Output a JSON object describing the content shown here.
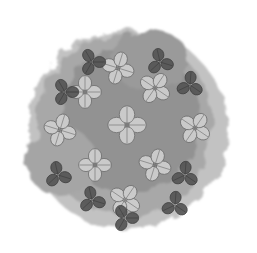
{
  "image": {
    "description": "Grayscale illustration of clustered four-leaf and three-leaf clovers over a soft watercolor-style gray blob on white background",
    "background": "#ffffff",
    "blob_colors": [
      "#8a8a8a",
      "#9c9c9c",
      "#b5b5b5",
      "#c8c8c8"
    ],
    "light_leaf": "#cfcfcf",
    "mid_leaf": "#8f8f8f",
    "dark_leaf": "#555555",
    "clovers": [
      {
        "x": 127,
        "y": 125,
        "r": 14,
        "tone": "light",
        "leaves": 4
      },
      {
        "x": 118,
        "y": 68,
        "r": 12,
        "tone": "light",
        "leaves": 4
      },
      {
        "x": 155,
        "y": 88,
        "r": 12,
        "tone": "light",
        "leaves": 4
      },
      {
        "x": 85,
        "y": 92,
        "r": 12,
        "tone": "light",
        "leaves": 4
      },
      {
        "x": 60,
        "y": 130,
        "r": 12,
        "tone": "light",
        "leaves": 4
      },
      {
        "x": 195,
        "y": 128,
        "r": 12,
        "tone": "light",
        "leaves": 4
      },
      {
        "x": 95,
        "y": 165,
        "r": 12,
        "tone": "light",
        "leaves": 4
      },
      {
        "x": 155,
        "y": 165,
        "r": 12,
        "tone": "light",
        "leaves": 4
      },
      {
        "x": 125,
        "y": 200,
        "r": 12,
        "tone": "light",
        "leaves": 4
      },
      {
        "x": 92,
        "y": 62,
        "r": 10,
        "tone": "dark",
        "leaves": 3
      },
      {
        "x": 160,
        "y": 62,
        "r": 10,
        "tone": "dark",
        "leaves": 3
      },
      {
        "x": 190,
        "y": 85,
        "r": 10,
        "tone": "dark",
        "leaves": 3
      },
      {
        "x": 65,
        "y": 92,
        "r": 10,
        "tone": "dark",
        "leaves": 3
      },
      {
        "x": 58,
        "y": 175,
        "r": 10,
        "tone": "dark",
        "leaves": 3
      },
      {
        "x": 185,
        "y": 175,
        "r": 10,
        "tone": "dark",
        "leaves": 3
      },
      {
        "x": 125,
        "y": 218,
        "r": 10,
        "tone": "dark",
        "leaves": 3
      },
      {
        "x": 92,
        "y": 200,
        "r": 10,
        "tone": "dark",
        "leaves": 3
      },
      {
        "x": 175,
        "y": 205,
        "r": 10,
        "tone": "dark",
        "leaves": 3
      }
    ]
  }
}
